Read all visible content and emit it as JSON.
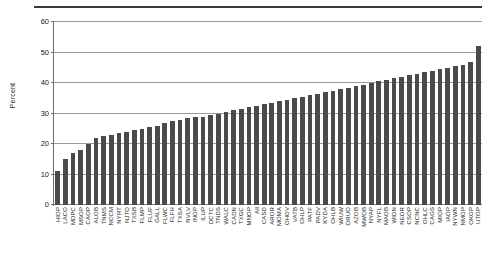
{
  "figure": {
    "y_axis_title": "Percent",
    "has_top_rule": true
  },
  "chart_data": {
    "type": "bar",
    "title": "",
    "subtitle": "",
    "xlabel": "",
    "ylabel": "Percent",
    "ylim": [
      0,
      60
    ],
    "yticks": [
      0,
      10,
      20,
      30,
      40,
      50,
      60
    ],
    "ytick_labels": [
      "0",
      "10",
      "20",
      "30",
      "40",
      "50",
      "60"
    ],
    "grid": true,
    "grid_axis": "y",
    "legend": false,
    "bar_color": "#4a4a4a",
    "categories": [
      "HIOP",
      "LACO",
      "MDPC",
      "MSOP",
      "CAOP",
      "ALOB",
      "TNMS",
      "NCCM",
      "NYRT",
      "NJTO",
      "TXSB",
      "FLMP",
      "FLUF",
      "GALL",
      "FLWC",
      "FLFH",
      "TXSA",
      "NVLV",
      "INOP",
      "ILUP",
      "DCTC",
      "TNDS",
      "WALC",
      "CADN",
      "TXGC",
      "MNOP",
      "All",
      "CASD",
      "AROR",
      "MOMA",
      "OHOV",
      "VATB",
      "OHLP",
      "PATF",
      "PADV",
      "KYDA",
      "OHLB",
      "WIUW",
      "ORUO",
      "AZOB",
      "MWOB",
      "NYAP",
      "NYFL",
      "MAOB",
      "WIDN",
      "NEOR",
      "CSOP",
      "NCNC",
      "OHLC",
      "CAGS",
      "MIOP",
      "IAOP",
      "NYWN",
      "NMOP",
      "OKOP",
      "UTOP"
    ],
    "values": [
      11,
      15,
      17,
      18,
      20,
      22,
      22.5,
      23,
      23.5,
      24,
      24.5,
      25,
      25.5,
      26,
      27,
      27.5,
      28,
      28.5,
      29,
      29,
      29.5,
      30,
      30.5,
      31,
      31.5,
      32,
      32.5,
      33,
      33.5,
      34,
      34.5,
      35,
      35.5,
      36,
      36.5,
      37,
      37.5,
      38,
      38.5,
      39,
      39.5,
      40,
      40.5,
      41,
      41.5,
      42,
      42.5,
      43,
      43.5,
      44,
      44.5,
      45,
      45.5,
      46,
      47,
      52
    ]
  }
}
